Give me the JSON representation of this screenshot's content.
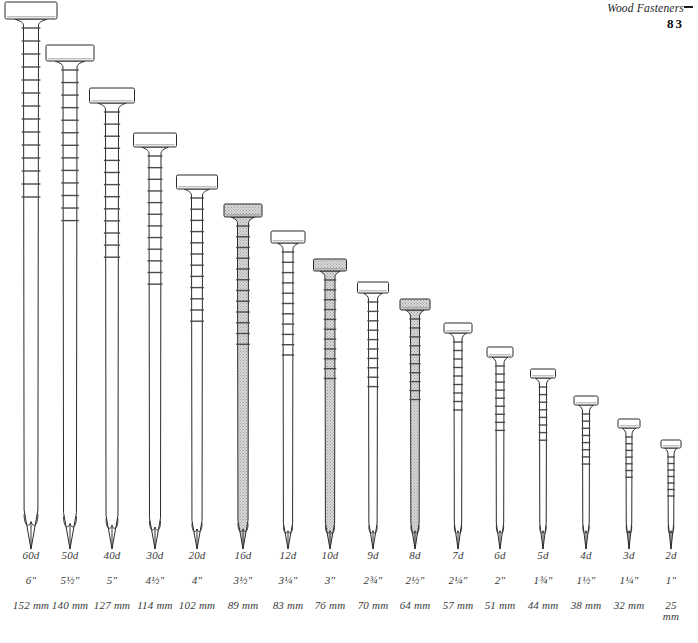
{
  "header": {
    "title": "Wood Fasteners",
    "page_number": "83",
    "rule_icon": "header-rule-mark"
  },
  "diagram": {
    "type": "scale-comparison-illustration",
    "background_color": "#ffffff",
    "outline_color": "#2b2b2b",
    "shaded_fill_color": "#cfcfcf",
    "plain_fill_color": "#ffffff",
    "units": {
      "penny": "d",
      "imperial": "inches",
      "metric": "millimeters"
    }
  },
  "nails": [
    {
      "penny": "60d",
      "inches": "6\"",
      "mm": "152 mm",
      "shaded": false,
      "center_x": 31,
      "head_y": 2,
      "tip_y": 549,
      "head_w": 52,
      "shank_w": 15,
      "head_h": 17
    },
    {
      "penny": "50d",
      "inches": "5½\"",
      "mm": "140 mm",
      "shaded": false,
      "center_x": 70,
      "head_y": 45,
      "tip_y": 549,
      "head_w": 48,
      "shank_w": 14,
      "head_h": 16
    },
    {
      "penny": "40d",
      "inches": "5\"",
      "mm": "127 mm",
      "shaded": false,
      "center_x": 112,
      "head_y": 88,
      "tip_y": 549,
      "head_w": 45,
      "shank_w": 13,
      "head_h": 15
    },
    {
      "penny": "30d",
      "inches": "4½\"",
      "mm": "114 mm",
      "shaded": false,
      "center_x": 155,
      "head_y": 133,
      "tip_y": 549,
      "head_w": 43,
      "shank_w": 12,
      "head_h": 14
    },
    {
      "penny": "20d",
      "inches": "4\"",
      "mm": "102 mm",
      "shaded": false,
      "center_x": 197,
      "head_y": 175,
      "tip_y": 549,
      "head_w": 41,
      "shank_w": 11,
      "head_h": 14
    },
    {
      "penny": "16d",
      "inches": "3½\"",
      "mm": "89 mm",
      "shaded": true,
      "center_x": 243,
      "head_y": 204,
      "tip_y": 549,
      "head_w": 38,
      "shank_w": 11,
      "head_h": 13
    },
    {
      "penny": "12d",
      "inches": "3¼\"",
      "mm": "83 mm",
      "shaded": false,
      "center_x": 288,
      "head_y": 231,
      "tip_y": 549,
      "head_w": 34,
      "shank_w": 10,
      "head_h": 12
    },
    {
      "penny": "10d",
      "inches": "3\"",
      "mm": "76 mm",
      "shaded": true,
      "center_x": 330,
      "head_y": 259,
      "tip_y": 549,
      "head_w": 33,
      "shank_w": 10,
      "head_h": 12
    },
    {
      "penny": "9d",
      "inches": "2¾\"",
      "mm": "70 mm",
      "shaded": false,
      "center_x": 373,
      "head_y": 282,
      "tip_y": 549,
      "head_w": 31,
      "shank_w": 9,
      "head_h": 11
    },
    {
      "penny": "8d",
      "inches": "2½\"",
      "mm": "64 mm",
      "shaded": true,
      "center_x": 415,
      "head_y": 299,
      "tip_y": 549,
      "head_w": 30,
      "shank_w": 9,
      "head_h": 11
    },
    {
      "penny": "7d",
      "inches": "2¼\"",
      "mm": "57 mm",
      "shaded": false,
      "center_x": 458,
      "head_y": 323,
      "tip_y": 549,
      "head_w": 28,
      "shank_w": 8,
      "head_h": 10
    },
    {
      "penny": "6d",
      "inches": "2\"",
      "mm": "51 mm",
      "shaded": false,
      "center_x": 500,
      "head_y": 347,
      "tip_y": 549,
      "head_w": 26,
      "shank_w": 8,
      "head_h": 10
    },
    {
      "penny": "5d",
      "inches": "1¾\"",
      "mm": "44 mm",
      "shaded": false,
      "center_x": 543,
      "head_y": 369,
      "tip_y": 549,
      "head_w": 25,
      "shank_w": 7,
      "head_h": 9
    },
    {
      "penny": "4d",
      "inches": "1½\"",
      "mm": "38 mm",
      "shaded": false,
      "center_x": 586,
      "head_y": 396,
      "tip_y": 549,
      "head_w": 24,
      "shank_w": 7,
      "head_h": 9
    },
    {
      "penny": "3d",
      "inches": "1¼\"",
      "mm": "32 mm",
      "shaded": false,
      "center_x": 629,
      "head_y": 419,
      "tip_y": 549,
      "head_w": 22,
      "shank_w": 6,
      "head_h": 9
    },
    {
      "penny": "2d",
      "inches": "1\"",
      "mm": "25\nmm",
      "shaded": false,
      "center_x": 671,
      "head_y": 440,
      "tip_y": 549,
      "head_w": 20,
      "shank_w": 6,
      "head_h": 8
    }
  ]
}
